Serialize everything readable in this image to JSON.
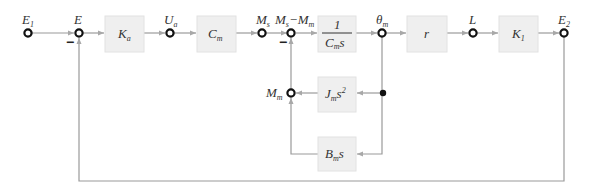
{
  "diagram": {
    "type": "block-diagram",
    "nodes": {
      "E1": {
        "label": "E",
        "sub": "1"
      },
      "E": {
        "label": "E",
        "sub": ""
      },
      "Ua": {
        "label": "U",
        "sub": "a"
      },
      "Ms": {
        "label": "M",
        "sub": "s"
      },
      "MsMm": {
        "label": "M",
        "sub": "s",
        "label2": "−M",
        "sub2": "m"
      },
      "theta_m": {
        "label": "θ",
        "sub": "m"
      },
      "L": {
        "label": "L",
        "sub": ""
      },
      "E2": {
        "label": "E",
        "sub": "2"
      },
      "Mm": {
        "label": "M",
        "sub": "m"
      }
    },
    "blocks": {
      "Ka": {
        "label": "K",
        "sub": "a"
      },
      "Cm": {
        "label": "C",
        "sub": "m"
      },
      "inv_Cms": {
        "numerator": "1",
        "den_main": "C",
        "den_sub": "m",
        "den_tail": "s"
      },
      "r": {
        "label": "r"
      },
      "K1": {
        "label": "K",
        "sub": "1"
      },
      "Jms2": {
        "label": "J",
        "sub": "m",
        "tail": "s",
        "sup": "2"
      },
      "Bms": {
        "label": "B",
        "sub": "m",
        "tail": "s"
      }
    },
    "signs": {
      "E_feedback": "−",
      "MsMm_feedback": "−"
    },
    "colors": {
      "line": "#9a9a9a",
      "block_fill": "#efefef",
      "node_stroke": "#111111"
    }
  }
}
